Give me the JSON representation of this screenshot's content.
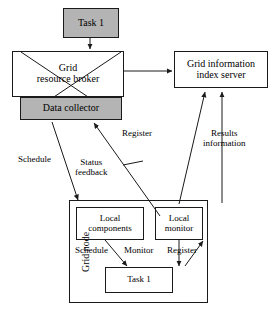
{
  "diagram": {
    "colors": {
      "fill_gray": "#b4b4b4",
      "stroke": "#1a1a1a",
      "background": "#ffffff"
    },
    "nodes": {
      "task_top": {
        "label": "Task 1",
        "style": "filled"
      },
      "grid_resource_broker": {
        "line1": "Grid",
        "line2": "resource broker",
        "style": "plain"
      },
      "data_collector": {
        "label": "Data collector",
        "style": "filled"
      },
      "index_server": {
        "line1": "Grid information",
        "line2": "index server",
        "style": "plain"
      },
      "grid_node": {
        "label": "Grid node",
        "style": "plain"
      },
      "local_components": {
        "line1": "Local",
        "line2": "components",
        "style": "plain"
      },
      "local_monitor": {
        "line1": "Local",
        "line2": "monitor",
        "style": "plain"
      },
      "task_bottom": {
        "label": "Task 1",
        "style": "plain"
      }
    },
    "edge_labels": {
      "schedule_outer": "Schedule",
      "status_feedback_l1": "Status",
      "status_feedback_l2": "feedback",
      "register_outer": "Register",
      "results_l1": "Results",
      "results_l2": "information",
      "schedule_inner": "Schedule",
      "monitor_inner": "Monitor",
      "register_inner": "Register"
    }
  }
}
